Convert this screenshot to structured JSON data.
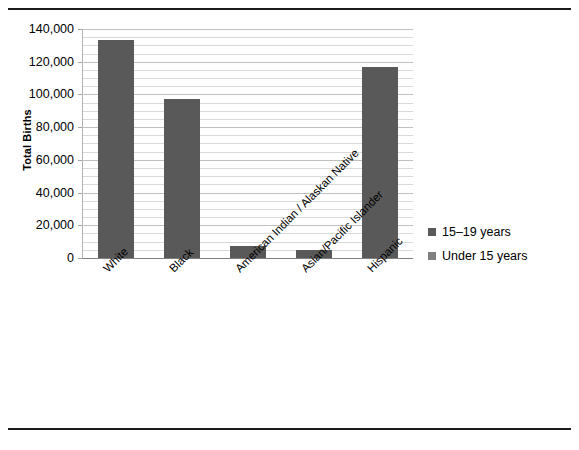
{
  "chart_data": {
    "type": "bar",
    "title": "",
    "subtitle": "",
    "xlabel": "",
    "ylabel": "Total Births",
    "categories": [
      "White",
      "Black",
      "American Indian / Alaskan Native",
      "Asian/Pacific Islander",
      "Hispanic"
    ],
    "series": [
      {
        "name": "15–19 years",
        "color": "#595959",
        "values": [
          133000,
          97500,
          7300,
          4900,
          116800
        ]
      },
      {
        "name": "Under 15 years",
        "color": "#808080",
        "values": [
          0,
          0,
          0,
          0,
          0
        ]
      }
    ],
    "ylim": [
      0,
      140000
    ],
    "ytick_values": [
      0,
      20000,
      40000,
      60000,
      80000,
      100000,
      120000,
      140000
    ],
    "ytick_labels": [
      "0",
      "20,000",
      "40,000",
      "60,000",
      "80,000",
      "100,000",
      "120,000",
      "140,000"
    ],
    "minor_gridline_step": 5000,
    "grid": true,
    "grid_axis": "y",
    "legend_position": "right",
    "xtick_rotation": -45
  },
  "legend": {
    "items": [
      {
        "label": "15–19 years",
        "color": "#595959"
      },
      {
        "label": "Under 15 years",
        "color": "#808080"
      }
    ]
  },
  "axis": {
    "y_title": "Total Births"
  }
}
